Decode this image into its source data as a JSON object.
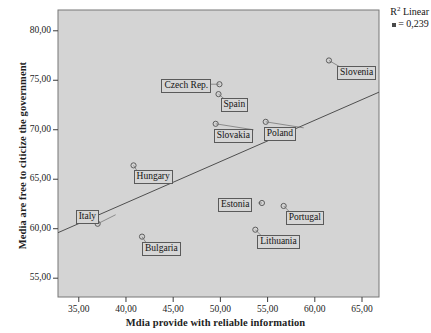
{
  "chart_data": {
    "type": "scatter",
    "title": "",
    "xlabel": "Mdia provide with reliable information",
    "ylabel": "Media are free to citicize the government",
    "xlim": [
      32.8,
      66.8
    ],
    "ylim": [
      53.1,
      82.1
    ],
    "xticks": [
      "35,00",
      "40,00",
      "45,00",
      "50,00",
      "55,00",
      "60,00",
      "65,00"
    ],
    "xtick_values": [
      35.0,
      40.0,
      45.0,
      50.0,
      55.0,
      60.0,
      65.0
    ],
    "yticks": [
      "80,00",
      "75,00",
      "70,00",
      "65,00",
      "60,00",
      "55,00"
    ],
    "ytick_values": [
      80.0,
      75.0,
      70.0,
      65.0,
      60.0,
      55.0
    ],
    "grid": false,
    "legend": "none",
    "plot_background": "#d4d4d4",
    "marker": "open-circle",
    "marker_color": "#5d5d5d",
    "line_color": "#4f4f4f",
    "points": [
      {
        "label": "Slovenia",
        "x": 61.5,
        "y": 77.0,
        "label_dx": 8,
        "label_dy": 6
      },
      {
        "label": "Czech Rep.",
        "x": 49.9,
        "y": 74.6,
        "label_dx": -58,
        "label_dy": -5
      },
      {
        "label": "Spain",
        "x": 49.8,
        "y": 73.6,
        "label_dx": 2,
        "label_dy": 4
      },
      {
        "label": "Slovakia",
        "x": 49.5,
        "y": 70.6,
        "label_dx": -2,
        "label_dy": 5
      },
      {
        "label": "Poland",
        "x": 54.8,
        "y": 70.8,
        "label_dx": -2,
        "label_dy": 5
      },
      {
        "label": "Hungary",
        "x": 40.8,
        "y": 66.4,
        "label_dx": 0,
        "label_dy": 5
      },
      {
        "label": "Italy",
        "x": 37.0,
        "y": 60.5,
        "label_dx": -22,
        "label_dy": -14
      },
      {
        "label": "Estonia",
        "x": 54.4,
        "y": 62.6,
        "label_dx": -44,
        "label_dy": -5
      },
      {
        "label": "Portugal",
        "x": 56.7,
        "y": 62.3,
        "label_dx": 2,
        "label_dy": 5
      },
      {
        "label": "Lithuania",
        "x": 53.7,
        "y": 59.9,
        "label_dx": 2,
        "label_dy": 5
      },
      {
        "label": "Bulgaria",
        "x": 41.7,
        "y": 59.2,
        "label_dx": 0,
        "label_dy": 5
      }
    ],
    "fit_line": {
      "type": "linear",
      "x_start": 32.8,
      "y_start": 59.6,
      "x_end": 66.8,
      "y_end": 73.8
    },
    "annotation": {
      "line1_prefix": "R",
      "line1_sup": "2",
      "line1_rest": " Linear",
      "line2": "= 0,239"
    }
  }
}
